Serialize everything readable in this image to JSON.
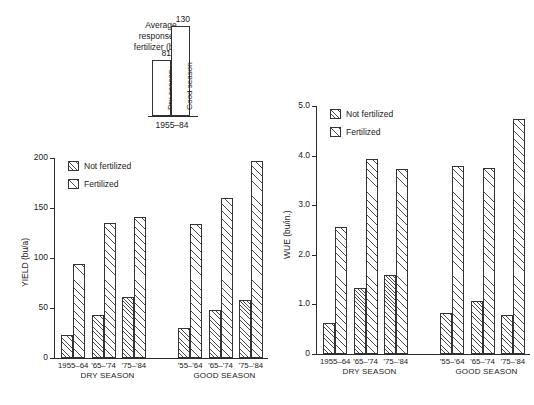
{
  "figure": {
    "background": "#ffffff",
    "ink": "#2b2b2b"
  },
  "inset": {
    "title_line1": "Average",
    "title_line2": "response to",
    "title_line3": "fertilizer (bu/a)",
    "xlabel": "1955–84",
    "bars": [
      {
        "label": "Dry season",
        "value": 81,
        "value_text": "81"
      },
      {
        "label": "Good season",
        "value": 130,
        "value_text": "130"
      }
    ],
    "ymax": 145
  },
  "legend": {
    "items": [
      {
        "label": "Not fertilized",
        "pattern": "hatch-dense"
      },
      {
        "label": "Fertilized",
        "pattern": "hatch-sparse"
      }
    ]
  },
  "chart_data": [
    {
      "type": "bar",
      "id": "yield-chart",
      "title": "",
      "xlabel": "",
      "ylabel": "YIELD (bu/a)",
      "ylim": [
        0,
        200
      ],
      "yticks": [
        0,
        50,
        100,
        150,
        200
      ],
      "ytick_labels": [
        "0",
        "50",
        "100",
        "150",
        "200"
      ],
      "grid": false,
      "legend_position": "upper-left",
      "groups": [
        {
          "name": "DRY SEASON",
          "categories": [
            "1955–64",
            "'65–'74",
            "'75–'84"
          ]
        },
        {
          "name": "GOOD SEASON",
          "categories": [
            "'55–'64",
            "'65–'74",
            "'75–'84"
          ]
        }
      ],
      "categories": [
        "1955–64",
        "'65–'74",
        "'75–'84",
        "'55–'64",
        "'65–'74",
        "'75–'84"
      ],
      "series": [
        {
          "name": "Not fertilized",
          "values": [
            23,
            43,
            61,
            30,
            48,
            58
          ]
        },
        {
          "name": "Fertilized",
          "values": [
            94,
            135,
            141,
            134,
            160,
            197
          ]
        }
      ]
    },
    {
      "type": "bar",
      "id": "wue-chart",
      "title": "",
      "xlabel": "",
      "ylabel": "WUE (bu/in.)",
      "ylim": [
        0,
        5.0
      ],
      "yticks": [
        0,
        1.0,
        2.0,
        3.0,
        4.0,
        5.0
      ],
      "ytick_labels": [
        "0",
        "1.0",
        "2.0",
        "3.0",
        "4.0",
        "5.0"
      ],
      "grid": false,
      "legend_position": "upper-left",
      "groups": [
        {
          "name": "DRY SEASON",
          "categories": [
            "1955–64",
            "'65–'74",
            "'75–'84"
          ]
        },
        {
          "name": "GOOD SEASON",
          "categories": [
            "'55–'64",
            "'65–'74",
            "'75–'84"
          ]
        }
      ],
      "categories": [
        "1955–64",
        "'65–'74",
        "'75–'84",
        "'55–'64",
        "'65–'74",
        "'75–'84"
      ],
      "series": [
        {
          "name": "Not fertilized",
          "values": [
            0.63,
            1.34,
            1.59,
            0.83,
            1.07,
            0.79
          ]
        },
        {
          "name": "Fertilized",
          "values": [
            2.56,
            3.94,
            3.72,
            3.8,
            3.75,
            4.73
          ]
        }
      ]
    }
  ]
}
